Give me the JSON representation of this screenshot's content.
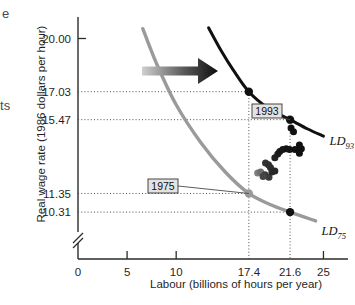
{
  "figure": {
    "margin_fragments": [
      {
        "name": "fragment-top",
        "text": "e"
      },
      {
        "name": "fragment-middle",
        "text": "ts"
      }
    ]
  },
  "chart_data": {
    "type": "scatter",
    "title": "",
    "xlabel": "Labour (billions of hours per year)",
    "ylabel": "Real wage rate (1986 dollars per hour)",
    "xlim": [
      0,
      27.5
    ],
    "ylim": [
      9.2,
      21.2
    ],
    "axis_break": true,
    "grid": false,
    "xticks": [
      0,
      5,
      10,
      17.4,
      21.6,
      25
    ],
    "xticklabels": [
      "0",
      "5",
      "10",
      "17.4",
      "21.6",
      "25"
    ],
    "xtick_major": [
      "0",
      "5",
      "10",
      "25"
    ],
    "xtick_dotted": [
      "17.4",
      "21.6"
    ],
    "yticks": [
      20.0,
      17.03,
      15.47,
      11.35,
      10.31
    ],
    "yticklabels": [
      "20.00",
      "17.03",
      "15.47",
      "11.35",
      "10.31"
    ],
    "ytick_major": [
      "20.00"
    ],
    "ytick_dotted": [
      "17.03",
      "15.47",
      "11.35",
      "10.31"
    ],
    "series": [
      {
        "name": "LD_75",
        "label": "LD",
        "label_sub": "75",
        "color": "#9a9a9a",
        "type": "curve",
        "points": [
          {
            "x": 6.6,
            "y": 20.55
          },
          {
            "x": 8.0,
            "y": 18.6
          },
          {
            "x": 10.0,
            "y": 16.3
          },
          {
            "x": 12.5,
            "y": 14.2
          },
          {
            "x": 15.0,
            "y": 12.55
          },
          {
            "x": 17.4,
            "y": 11.35
          },
          {
            "x": 19.5,
            "y": 10.75
          },
          {
            "x": 21.6,
            "y": 10.31
          },
          {
            "x": 24.2,
            "y": 9.82
          }
        ]
      },
      {
        "name": "LD_93",
        "label": "LD",
        "label_sub": "93",
        "color": "#111111",
        "type": "curve",
        "points": [
          {
            "x": 13.3,
            "y": 20.6
          },
          {
            "x": 14.6,
            "y": 19.3
          },
          {
            "x": 15.8,
            "y": 18.25
          },
          {
            "x": 17.4,
            "y": 17.03
          },
          {
            "x": 19.4,
            "y": 16.1
          },
          {
            "x": 21.6,
            "y": 15.47
          },
          {
            "x": 23.4,
            "y": 14.95
          },
          {
            "x": 25.0,
            "y": 14.55
          }
        ]
      }
    ],
    "marked_points": [
      {
        "name": "point-1993-a",
        "x": 17.4,
        "y": 17.03,
        "color": "#111111",
        "r": 4.2
      },
      {
        "name": "point-1993-b",
        "x": 21.6,
        "y": 15.47,
        "color": "#111111",
        "r": 4.2
      },
      {
        "name": "point-1975-a",
        "x": 17.4,
        "y": 11.35,
        "color": "#9a9a9a",
        "r": 4.2
      },
      {
        "name": "point-1975-b",
        "x": 21.6,
        "y": 10.31,
        "color": "#111111",
        "r": 4.2
      }
    ],
    "scatter_points": [
      {
        "x": 18.3,
        "y": 12.5,
        "color": "#7d7d7d"
      },
      {
        "x": 18.6,
        "y": 12.55,
        "color": "#6e6e6e"
      },
      {
        "x": 19.05,
        "y": 12.4,
        "color": "#3d3d3d"
      },
      {
        "x": 19.45,
        "y": 12.25,
        "color": "#3a3a3a"
      },
      {
        "x": 19.6,
        "y": 12.8,
        "color": "#2d2d2d"
      },
      {
        "x": 19.75,
        "y": 12.55,
        "color": "#2a2a2a"
      },
      {
        "x": 19.1,
        "y": 13.05,
        "color": "#333333"
      },
      {
        "x": 19.4,
        "y": 12.95,
        "color": "#2e2e2e"
      },
      {
        "x": 20.05,
        "y": 13.35,
        "color": "#222222"
      },
      {
        "x": 20.35,
        "y": 13.55,
        "color": "#1e1e1e"
      },
      {
        "x": 20.55,
        "y": 13.7,
        "color": "#1a1a1a"
      },
      {
        "x": 20.85,
        "y": 13.8,
        "color": "#181818"
      },
      {
        "x": 21.2,
        "y": 13.85,
        "color": "#151515"
      },
      {
        "x": 21.55,
        "y": 13.8,
        "color": "#141414"
      },
      {
        "x": 22.1,
        "y": 13.8,
        "color": "#121212"
      },
      {
        "x": 22.55,
        "y": 14.05,
        "color": "#111111"
      },
      {
        "x": 22.75,
        "y": 13.85,
        "color": "#111111"
      },
      {
        "x": 22.55,
        "y": 13.6,
        "color": "#111111"
      },
      {
        "x": 21.95,
        "y": 14.8,
        "color": "#111111"
      },
      {
        "x": 21.7,
        "y": 15.0,
        "color": "#111111"
      },
      {
        "x": 18.85,
        "y": 12.3,
        "color": "#454545"
      },
      {
        "x": 20.05,
        "y": 12.6,
        "color": "#262626"
      }
    ],
    "annotations": [
      {
        "name": "callout-1993",
        "text": "1993",
        "target_x": 21.6,
        "target_y": 15.47
      },
      {
        "name": "callout-1975",
        "text": "1975",
        "target_x": 17.4,
        "target_y": 11.35
      }
    ],
    "arrow": {
      "name": "shift-arrow",
      "description": "rightward shift arrow from LD75 to LD93",
      "color_start": "#c9c9c9",
      "color_end": "#111111"
    }
  }
}
